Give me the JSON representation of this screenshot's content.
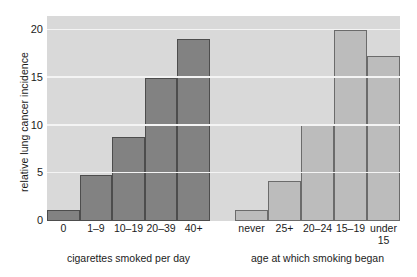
{
  "chart_data": {
    "type": "bar",
    "title": "",
    "subtitle": "",
    "ylabel": "relative lung cancer incidence",
    "ylim": [
      0,
      21.5
    ],
    "yticks": [
      0,
      5,
      10,
      15,
      20
    ],
    "ytick_labels": [
      "0",
      "5",
      "10",
      "15",
      "20"
    ],
    "grid": true,
    "grid_axis": "y",
    "legend": "none",
    "panels": [
      {
        "name": "cigarettes-smoked-per-day",
        "xlabel": "cigarettes smoked per day",
        "bar_color": "#828282",
        "categories": [
          "0",
          "1–9",
          "10–19",
          "20–39",
          "40+"
        ],
        "values": [
          1.2,
          4.8,
          8.8,
          15.0,
          19.1
        ]
      },
      {
        "name": "age-at-which-smoking-began",
        "xlabel": "age at which smoking began",
        "bar_color": "#bcbcbc",
        "categories": [
          "never",
          "25+",
          "20–24",
          "15–19",
          "under\n15"
        ],
        "values": [
          1.2,
          4.2,
          10.2,
          20.0,
          17.3
        ]
      }
    ],
    "colors": {
      "panel_background": "#d9d9d9",
      "gridline": "#f4f4f4",
      "bar_dark": "#828282",
      "bar_light": "#bcbcbc",
      "bar_edge": "#4d4d4d",
      "text": "#1b1b1b",
      "figure_background": "#ffffff"
    }
  }
}
